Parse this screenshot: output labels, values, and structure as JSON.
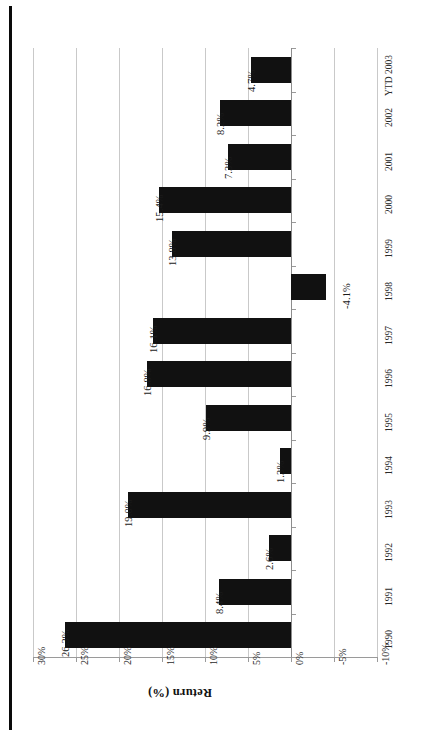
{
  "chart_data": {
    "type": "bar",
    "title": "",
    "orientation": "horizontal-rotated",
    "xlabel": "",
    "ylabel": "Return (%)",
    "categories": [
      "1990",
      "1991",
      "1992",
      "1993",
      "1994",
      "1995",
      "1996",
      "1997",
      "1998",
      "1999",
      "2000",
      "2001",
      "2002",
      "YTD 2003"
    ],
    "values": [
      26.3,
      8.4,
      2.6,
      19.0,
      1.3,
      9.9,
      16.8,
      16.1,
      -4.1,
      13.8,
      15.4,
      7.3,
      8.2,
      4.7
    ],
    "data_labels": [
      "26.3%",
      "8.4%",
      "2.6%",
      "19.0%",
      "1.3%",
      "9.9%",
      "16.8%",
      "16.1%",
      "-4.1%",
      "13.8%",
      "15.4%",
      "7.3%",
      "8.2%",
      "4.7%"
    ],
    "ylim": [
      -10,
      30
    ],
    "tick_labels": [
      "30%",
      "25%",
      "20%",
      "15%",
      "10%",
      "5%",
      "0%",
      "-5%",
      "-10%"
    ],
    "tick_values": [
      30,
      25,
      20,
      15,
      10,
      5,
      0,
      -5,
      -10
    ],
    "grid": true,
    "legend": "none",
    "bar_color": "#111111",
    "gridline_color": "#c9c9c9",
    "axis_color": "#9a9a9a"
  },
  "axis": {
    "value_axis_title": "Return (%)"
  }
}
